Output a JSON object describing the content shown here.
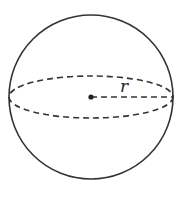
{
  "diagram": {
    "type": "sphere",
    "radius_label": "r",
    "colors": {
      "stroke": "#333333",
      "background": "#ffffff"
    },
    "elements": [
      {
        "kind": "outline-circle",
        "style": "solid"
      },
      {
        "kind": "equator-ellipse",
        "style": "dashed"
      },
      {
        "kind": "center-point"
      },
      {
        "kind": "radius-segment",
        "style": "dashed",
        "label": "r"
      }
    ]
  }
}
